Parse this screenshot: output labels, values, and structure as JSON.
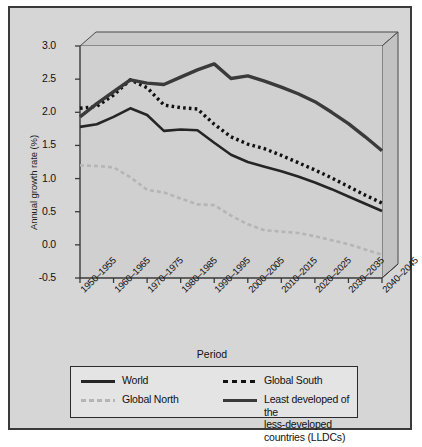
{
  "chart_data": {
    "type": "line",
    "title": "",
    "xlabel": "Period",
    "ylabel": "Annual growth rate (%)",
    "ylim": [
      -0.5,
      3.0
    ],
    "yticks": [
      "3.0",
      "2.5",
      "2.0",
      "1.5",
      "1.0",
      "0.5",
      "0.0",
      "-0.5"
    ],
    "ytick_values": [
      3.0,
      2.5,
      2.0,
      1.5,
      1.0,
      0.5,
      0.0,
      -0.5
    ],
    "grid": false,
    "legend_position": "bottom",
    "categories": [
      "1950–1955",
      "1955–1960",
      "1960–1965",
      "1965–1970",
      "1970–1975",
      "1975–1980",
      "1980–1985",
      "1985–1990",
      "1990–1995",
      "1995–2000",
      "2000–2005",
      "2005–2010",
      "2010–2015",
      "2015–2020",
      "2020–2025",
      "2025–2030",
      "2030–2035",
      "2035–2040",
      "2040–2045"
    ],
    "xtick_labels": [
      "1950–1955",
      "1960–1965",
      "1970–1975",
      "1980–1985",
      "1990–1995",
      "2000–2005",
      "2010–2015",
      "2020–2025",
      "2030–2035",
      "2040–2045"
    ],
    "xtick_indices": [
      0,
      2,
      4,
      6,
      8,
      10,
      12,
      14,
      16,
      18
    ],
    "series": [
      {
        "name": "World",
        "style": "solid",
        "color": "#252525",
        "width": 2.6,
        "values": [
          1.78,
          1.82,
          1.93,
          2.06,
          1.96,
          1.72,
          1.74,
          1.73,
          1.54,
          1.36,
          1.25,
          1.18,
          1.11,
          1.03,
          0.94,
          0.84,
          0.73,
          0.62,
          0.51
        ]
      },
      {
        "name": "Global South",
        "style": "dotted",
        "color": "#111111",
        "width": 3.4,
        "values": [
          2.06,
          2.09,
          2.26,
          2.49,
          2.37,
          2.11,
          2.07,
          2.05,
          1.82,
          1.63,
          1.52,
          1.45,
          1.35,
          1.24,
          1.13,
          1.01,
          0.88,
          0.75,
          0.63
        ]
      },
      {
        "name": "Global North",
        "style": "dashed",
        "color": "#b5b5b5",
        "width": 2.6,
        "values": [
          1.2,
          1.19,
          1.17,
          1.02,
          0.83,
          0.79,
          0.7,
          0.61,
          0.6,
          0.44,
          0.31,
          0.22,
          0.2,
          0.18,
          0.13,
          0.07,
          0.01,
          -0.07,
          -0.15
        ]
      },
      {
        "name": "Least developed of the less-developed countries (LLDCs)",
        "style": "solid",
        "color": "#3a3a3a",
        "width": 3.4,
        "values": [
          1.93,
          2.13,
          2.31,
          2.49,
          2.44,
          2.42,
          2.53,
          2.64,
          2.73,
          2.51,
          2.55,
          2.47,
          2.38,
          2.28,
          2.16,
          2.0,
          1.83,
          1.63,
          1.42
        ]
      }
    ],
    "legend": [
      {
        "label": "World",
        "key": "solid-world"
      },
      {
        "label": "Global South",
        "key": "dot-south"
      },
      {
        "label": "Global North",
        "key": "dash-north"
      },
      {
        "label": "Least developed of the",
        "label2": "less-developed countries (LLDCs)",
        "key": "solid-lldc"
      }
    ]
  }
}
